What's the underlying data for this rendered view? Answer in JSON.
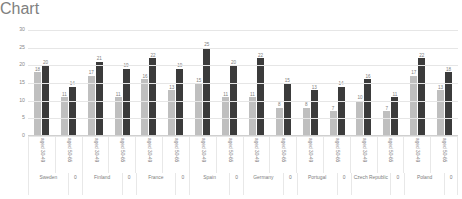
{
  "chart_data": {
    "type": "bar",
    "title": "",
    "subtitle": "",
    "xlabel": "",
    "ylabel": "",
    "ylim": [
      0,
      30
    ],
    "yticks": [
      0,
      5,
      10,
      15,
      20,
      25,
      30
    ],
    "grid": true,
    "legend_position": "bottom",
    "categories": [
      "aged 30-49",
      "aged 50-65",
      "aged 30-49",
      "aged 50-65",
      "aged 30-49",
      "aged 50-65",
      "aged 30-49",
      "aged 50-65",
      "aged 30-49",
      "aged 50-65",
      "aged 30-49",
      "aged 50-65",
      "aged 30-49",
      "aged 50-65",
      "aged 30-49",
      "aged 50-65"
    ],
    "groups": [
      "Sweden",
      "Finland",
      "France",
      "Spain",
      "Germany",
      "Portugal",
      "Czech Republic",
      "Poland"
    ],
    "group_separator_label": "0",
    "series": [
      {
        "name": "Men",
        "color": "#bfbfbf",
        "values": [
          18,
          11,
          17,
          11,
          16,
          13,
          15,
          11,
          11,
          8,
          8,
          7,
          10,
          7,
          17,
          13
        ]
      },
      {
        "name": "Women",
        "color": "#3b3b3b",
        "values": [
          20,
          14,
          21,
          19,
          22,
          19,
          25,
          20,
          22,
          15,
          13,
          14,
          16,
          11,
          22,
          18
        ]
      }
    ]
  }
}
